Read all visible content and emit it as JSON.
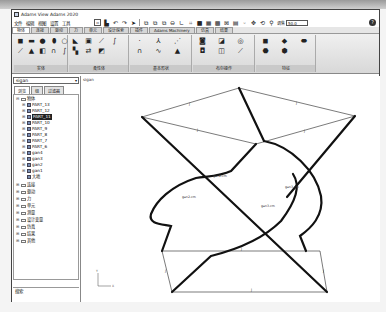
{
  "window": {
    "title": "Adams View Adams 2020"
  },
  "menu": {
    "items": [
      "文件",
      "编辑",
      "视图",
      "设置",
      "工具"
    ]
  },
  "toolbar": {
    "icons": [
      "new-icon",
      "save-icon",
      "undo-icon",
      "redo-icon",
      "select-pointer-icon",
      "zoom-box-icon",
      "zoom-fit-icon",
      "zoom-icon",
      "view-icon",
      "coordinate-icon",
      "grid-icon",
      "render-icon",
      "view-front-icon",
      "view-side-icon",
      "view-iso-icon",
      "view-top-icon",
      "point-icon",
      "translate-icon",
      "rotate-icon",
      "zoom-magnifier-icon"
    ],
    "zoom_label": "调焦",
    "zoom_value": "50.0",
    "help_label": "?"
  },
  "ribbon": {
    "tabs": [
      {
        "label": "物体",
        "active": true
      },
      {
        "label": "连接",
        "active": false
      },
      {
        "label": "驱动",
        "active": false
      },
      {
        "label": "力",
        "active": false
      },
      {
        "label": "单元",
        "active": false
      },
      {
        "label": "设计探索",
        "active": false
      },
      {
        "label": "插件",
        "active": false
      },
      {
        "label": "Adams Machinery",
        "active": false
      },
      {
        "label": "仿真",
        "active": false
      },
      {
        "label": "结果",
        "active": false
      }
    ],
    "groups": [
      {
        "label": "实体",
        "icons": [
          "box-icon",
          "link-icon",
          "cylinder-icon",
          "sphere-icon",
          "torus-icon",
          "line-icon",
          "frustum-icon",
          "extrusion-icon",
          "revolution-icon",
          "spline-icon"
        ]
      },
      {
        "label": "柔性体",
        "icons": [
          "flex-import-icon",
          "flex-viewflex-icon",
          "flex-beam-icon",
          "flex-spring-icon",
          "flex-rigid-icon",
          "flex-swap-icon",
          "flex-mesh-icon"
        ]
      },
      {
        "label": "基本形状",
        "icons": [
          "marker-icon",
          "point-icon",
          "polyline-icon",
          "arc-icon",
          "spline-curve-icon",
          "plane-icon"
        ]
      },
      {
        "label": "布尔操作",
        "icons": [
          "union-icon",
          "intersect-icon",
          "split-icon",
          "merge-icon",
          "cut-icon",
          "chain-icon"
        ]
      },
      {
        "label": "特征",
        "icons": [
          "chamfer-icon",
          "fillet-icon",
          "hole-icon",
          "boss-icon",
          "shell-icon"
        ]
      }
    ]
  },
  "left_panel": {
    "model_select": "sigan",
    "tabs": [
      {
        "label": "浏览",
        "active": true
      },
      {
        "label": "组",
        "active": false
      },
      {
        "label": "过滤器",
        "active": false
      }
    ],
    "tree": [
      {
        "label": "物体",
        "level": 0,
        "expanded": true,
        "type": "folder"
      },
      {
        "label": "PART_13",
        "level": 1,
        "type": "part"
      },
      {
        "label": "PART_12",
        "level": 1,
        "type": "part"
      },
      {
        "label": "PART_11",
        "level": 1,
        "type": "part",
        "selected": true
      },
      {
        "label": "PART_10",
        "level": 1,
        "type": "part"
      },
      {
        "label": "PART_9",
        "level": 1,
        "type": "part"
      },
      {
        "label": "PART_8",
        "level": 1,
        "type": "part"
      },
      {
        "label": "PART_7",
        "level": 1,
        "type": "part"
      },
      {
        "label": "PART_6",
        "level": 1,
        "type": "part"
      },
      {
        "label": "gan4",
        "level": 1,
        "type": "part"
      },
      {
        "label": "gan3",
        "level": 1,
        "type": "part"
      },
      {
        "label": "gan2",
        "level": 1,
        "type": "part"
      },
      {
        "label": "gan1",
        "level": 1,
        "type": "part"
      },
      {
        "label": "大地",
        "level": 1,
        "type": "part"
      },
      {
        "label": "连接",
        "level": 0,
        "type": "folder"
      },
      {
        "label": "驱动",
        "level": 0,
        "type": "folder"
      },
      {
        "label": "力",
        "level": 0,
        "type": "folder"
      },
      {
        "label": "单元",
        "level": 0,
        "type": "folder"
      },
      {
        "label": "测量",
        "level": 0,
        "type": "folder"
      },
      {
        "label": "设计变量",
        "level": 0,
        "type": "folder"
      },
      {
        "label": "仿真",
        "level": 0,
        "type": "folder"
      },
      {
        "label": "结果",
        "level": 0,
        "type": "folder"
      },
      {
        "label": "其他",
        "level": 0,
        "type": "folder"
      }
    ],
    "status_text": "搜索"
  },
  "canvas": {
    "model_name": "sigan",
    "part_labels": [
      "gan2.cm",
      "gan2.cm",
      "gan3.cm",
      "gan3.cm"
    ],
    "joint_labels": [
      "J",
      "J",
      "J",
      "J",
      "J",
      "J",
      "J",
      "J"
    ],
    "triad_labels": {
      "y": "Y",
      "x": "X"
    }
  }
}
